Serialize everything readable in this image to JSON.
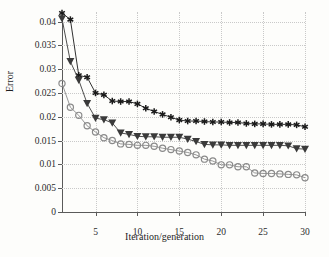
{
  "chart_data": {
    "type": "line",
    "title": "",
    "xlabel": "Iteration/generation",
    "ylabel": "Error",
    "xlim": [
      1,
      30
    ],
    "ylim": [
      0,
      0.042
    ],
    "grid": true,
    "legend": "none",
    "x": [
      1,
      2,
      3,
      4,
      5,
      6,
      7,
      8,
      9,
      10,
      11,
      12,
      13,
      14,
      15,
      16,
      17,
      18,
      19,
      20,
      21,
      22,
      23,
      24,
      25,
      26,
      27,
      28,
      29,
      30
    ],
    "xticks": [
      "5",
      "10",
      "15",
      "20",
      "25",
      "30"
    ],
    "xtick_values": [
      5,
      10,
      15,
      20,
      25,
      30
    ],
    "yticks": [
      "0",
      "0.005",
      "0.01",
      "0.015",
      "0.02",
      "0.025",
      "0.03",
      "0.035",
      "0.04"
    ],
    "ytick_values": [
      0,
      0.005,
      0.01,
      0.015,
      0.02,
      0.025,
      0.03,
      0.035,
      0.04
    ],
    "series": [
      {
        "name": "series-star",
        "marker": "star",
        "color": "#1a1a1a",
        "values": [
          0.0418,
          0.0404,
          0.0287,
          0.0283,
          0.025,
          0.0246,
          0.0233,
          0.0232,
          0.0232,
          0.0227,
          0.0218,
          0.0211,
          0.0205,
          0.0199,
          0.0193,
          0.0191,
          0.0191,
          0.019,
          0.0189,
          0.0189,
          0.0188,
          0.0188,
          0.0186,
          0.0185,
          0.0185,
          0.0184,
          0.0184,
          0.0184,
          0.0183,
          0.0179
        ]
      },
      {
        "name": "series-triangle",
        "marker": "triangle-down",
        "color": "#3a3a3a",
        "values": [
          0.0406,
          0.0316,
          0.0277,
          0.0228,
          0.0197,
          0.0194,
          0.0187,
          0.0166,
          0.0163,
          0.0159,
          0.0158,
          0.0158,
          0.0157,
          0.0157,
          0.0157,
          0.0153,
          0.0148,
          0.0142,
          0.0141,
          0.0141,
          0.014,
          0.014,
          0.014,
          0.014,
          0.014,
          0.014,
          0.014,
          0.0139,
          0.0133,
          0.0132
        ]
      },
      {
        "name": "series-circle",
        "marker": "circle-open",
        "color": "#8a8a8a",
        "values": [
          0.027,
          0.022,
          0.0203,
          0.0181,
          0.0168,
          0.0156,
          0.015,
          0.0143,
          0.0142,
          0.014,
          0.014,
          0.0138,
          0.0134,
          0.0131,
          0.0128,
          0.0125,
          0.012,
          0.0111,
          0.0107,
          0.0099,
          0.0099,
          0.0095,
          0.0095,
          0.0082,
          0.0081,
          0.0081,
          0.008,
          0.0079,
          0.0078,
          0.0072
        ]
      }
    ]
  },
  "figure": {
    "background_color": "#fdfdfb",
    "axis_color": "#5a5a5a",
    "grid_color": "#c9c9c9"
  }
}
